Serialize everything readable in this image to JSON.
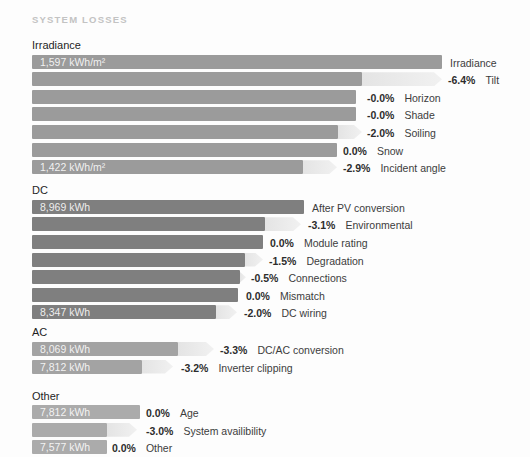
{
  "title": "SYSTEM LOSSES",
  "colors": {
    "irradiance_bar": "#9b9b9b",
    "dc_bar": "#7f7f7f",
    "ac_bar": "#a3a3a3",
    "other_bar": "#ababab",
    "arrow": "#ececec",
    "title_text": "#c3c3c3",
    "section_text": "#1f1f1f",
    "percent_text": "#2d2d2d",
    "label_text": "#3c3c3c",
    "inbar_text": "#ffffff"
  },
  "chart_data": {
    "type": "bar",
    "subtype": "waterfall-losses",
    "orientation": "horizontal",
    "title": "SYSTEM LOSSES",
    "grid": false,
    "legend": false,
    "groups": [
      {
        "name": "Irradiance",
        "unit": "kWh/m²",
        "start_value": 1597,
        "end_value": 1422,
        "steps": [
          {
            "label": "Irradiance",
            "value": 1597
          },
          {
            "label": "Tilt",
            "loss_pct": -6.4
          },
          {
            "label": "Horizon",
            "loss_pct": -0.0
          },
          {
            "label": "Shade",
            "loss_pct": -0.0
          },
          {
            "label": "Soiling",
            "loss_pct": -2.0
          },
          {
            "label": "Snow",
            "loss_pct": 0.0
          },
          {
            "label": "Incident angle",
            "loss_pct": -2.9,
            "value": 1422
          }
        ]
      },
      {
        "name": "DC",
        "unit": "kWh",
        "start_value": 8969,
        "end_value": 8347,
        "steps": [
          {
            "label": "After PV conversion",
            "value": 8969
          },
          {
            "label": "Environmental",
            "loss_pct": -3.1
          },
          {
            "label": "Module rating",
            "loss_pct": 0.0
          },
          {
            "label": "Degradation",
            "loss_pct": -1.5
          },
          {
            "label": "Connections",
            "loss_pct": -0.5
          },
          {
            "label": "Mismatch",
            "loss_pct": 0.0
          },
          {
            "label": "DC wiring",
            "loss_pct": -2.0,
            "value": 8347
          }
        ]
      },
      {
        "name": "AC",
        "unit": "kWh",
        "start_value": 8069,
        "end_value": 7812,
        "steps": [
          {
            "label": "DC/AC conversion",
            "loss_pct": -3.3,
            "value": 8069
          },
          {
            "label": "Inverter clipping",
            "loss_pct": -3.2,
            "value": 7812
          }
        ]
      },
      {
        "name": "Other",
        "unit": "kWh",
        "start_value": 7812,
        "end_value": 7577,
        "steps": [
          {
            "label": "Age",
            "loss_pct": 0.0,
            "value": 7812
          },
          {
            "label": "System availibility",
            "loss_pct": -3.0
          },
          {
            "label": "Other",
            "loss_pct": 0.0,
            "value": 7577
          }
        ]
      }
    ]
  },
  "sections": [
    {
      "id": "irradiance",
      "label": "Irradiance",
      "bar_color": "#9b9b9b",
      "rows": [
        {
          "key": "irradiance",
          "bar_px": 410,
          "arrow_px": 0,
          "text_x_px": 418,
          "bar_value": "1,597 kWh/m²",
          "percent": "",
          "label": "Irradiance"
        },
        {
          "key": "tilt",
          "bar_px": 330,
          "arrow_px": 80,
          "text_x_px": 416,
          "bar_value": "",
          "percent": "-6.4%",
          "label": "Tilt"
        },
        {
          "key": "horizon",
          "bar_px": 324,
          "arrow_px": 0,
          "text_x_px": 335,
          "bar_value": "",
          "percent": "-0.0%",
          "label": "Horizon"
        },
        {
          "key": "shade",
          "bar_px": 324,
          "arrow_px": 0,
          "text_x_px": 335,
          "bar_value": "",
          "percent": "-0.0%",
          "label": "Shade"
        },
        {
          "key": "soiling",
          "bar_px": 306,
          "arrow_px": 24,
          "text_x_px": 335,
          "bar_value": "",
          "percent": "-2.0%",
          "label": "Soiling"
        },
        {
          "key": "snow",
          "bar_px": 305,
          "arrow_px": 0,
          "text_x_px": 311,
          "bar_value": "",
          "percent": "0.0%",
          "label": "Snow"
        },
        {
          "key": "incident-angle",
          "bar_px": 271,
          "arrow_px": 34,
          "text_x_px": 311,
          "bar_value": "1,422 kWh/m²",
          "percent": "-2.9%",
          "label": "Incident angle"
        }
      ]
    },
    {
      "id": "dc",
      "label": "DC",
      "bar_color": "#7f7f7f",
      "rows": [
        {
          "key": "after-pv-conversion",
          "bar_px": 272,
          "arrow_px": 0,
          "text_x_px": 280,
          "bar_value": "8,969 kWh",
          "percent": "",
          "label": "After PV conversion"
        },
        {
          "key": "environmental",
          "bar_px": 233,
          "arrow_px": 36,
          "text_x_px": 276,
          "bar_value": "",
          "percent": "-3.1%",
          "label": "Environmental"
        },
        {
          "key": "module-rating",
          "bar_px": 231,
          "arrow_px": 0,
          "text_x_px": 238,
          "bar_value": "",
          "percent": "0.0%",
          "label": "Module rating"
        },
        {
          "key": "degradation",
          "bar_px": 213,
          "arrow_px": 18,
          "text_x_px": 237,
          "bar_value": "",
          "percent": "-1.5%",
          "label": "Degradation"
        },
        {
          "key": "connections",
          "bar_px": 208,
          "arrow_px": 6,
          "text_x_px": 219,
          "bar_value": "",
          "percent": "-0.5%",
          "label": "Connections"
        },
        {
          "key": "mismatch",
          "bar_px": 206,
          "arrow_px": 0,
          "text_x_px": 214,
          "bar_value": "",
          "percent": "0.0%",
          "label": "Mismatch"
        },
        {
          "key": "dc-wiring",
          "bar_px": 184,
          "arrow_px": 21,
          "text_x_px": 212,
          "bar_value": "8,347 kWh",
          "percent": "-2.0%",
          "label": "DC wiring"
        }
      ]
    },
    {
      "id": "ac",
      "label": "AC",
      "bar_color": "#a3a3a3",
      "rows": [
        {
          "key": "dc-ac-conversion",
          "bar_px": 146,
          "arrow_px": 36,
          "text_x_px": 188,
          "bar_value": "8,069 kWh",
          "percent": "-3.3%",
          "label": "DC/AC conversion"
        },
        {
          "key": "inverter-clipping",
          "bar_px": 110,
          "arrow_px": 31,
          "text_x_px": 149,
          "bar_value": "7,812 kWh",
          "percent": "-3.2%",
          "label": "Inverter clipping"
        }
      ]
    },
    {
      "id": "other",
      "label": "Other",
      "bar_color": "#ababab",
      "rows": [
        {
          "key": "age",
          "bar_px": 108,
          "arrow_px": 0,
          "text_x_px": 114,
          "bar_value": "7,812 kWh",
          "percent": "0.0%",
          "label": "Age"
        },
        {
          "key": "system-availibility",
          "bar_px": 75,
          "arrow_px": 30,
          "text_x_px": 114,
          "bar_value": "",
          "percent": "-3.0%",
          "label": "System availibility"
        },
        {
          "key": "other",
          "bar_px": 75,
          "arrow_px": 0,
          "text_x_px": 80,
          "bar_value": "7,577 kWh",
          "percent": "0.0%",
          "label": "Other"
        }
      ]
    }
  ]
}
